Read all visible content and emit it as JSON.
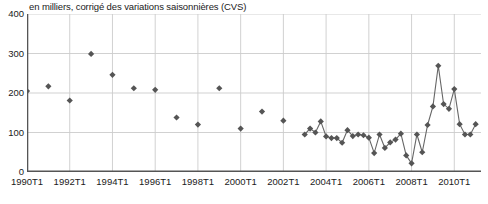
{
  "subtitle": "en milliers, corrigé des variations saisonnières (CVS)",
  "colors": {
    "marker": "#555555",
    "line": "#666666",
    "grid": "#cccccc",
    "axis": "#555555",
    "text": "#1a1a1a",
    "background": "#ffffff"
  },
  "chart_data": {
    "type": "scatter",
    "title": "",
    "subtitle": "en milliers, corrigé des variations saisonnières (CVS)",
    "xlabel": "",
    "ylabel": "",
    "ylim": [
      0,
      400
    ],
    "yticks": [
      0,
      100,
      200,
      300,
      400
    ],
    "ytick_labels": [
      "0",
      "100",
      "200",
      "300",
      "400"
    ],
    "xlim": [
      1990,
      2011.25
    ],
    "xticks": [
      1990,
      1992,
      1994,
      1996,
      1998,
      2000,
      2002,
      2004,
      2006,
      2008,
      2010
    ],
    "xtick_labels": [
      "1990T1",
      "1992T1",
      "1994T1",
      "1996T1",
      "1998T1",
      "2000T1",
      "2002T1",
      "2004T1",
      "2006T1",
      "2008T1",
      "2010T1"
    ],
    "grid": true,
    "legend": "none",
    "series": [
      {
        "name": "Points annuels (non reliés)",
        "marker": "diamond",
        "connected": false,
        "x": [
          1990,
          1991,
          1992,
          1993,
          1994,
          1995,
          1996,
          1997,
          1998,
          1999,
          2000,
          2001,
          2002
        ],
        "values": [
          205,
          217,
          181,
          299,
          246,
          212,
          208,
          138,
          120,
          212,
          110,
          153,
          130
        ]
      },
      {
        "name": "Série trimestrielle (reliée)",
        "marker": "diamond",
        "connected": true,
        "x": [
          2003.0,
          2003.25,
          2003.5,
          2003.75,
          2004.0,
          2004.25,
          2004.5,
          2004.75,
          2005.0,
          2005.25,
          2005.5,
          2005.75,
          2006.0,
          2006.25,
          2006.5,
          2006.75,
          2007.0,
          2007.25,
          2007.5,
          2007.75,
          2008.0,
          2008.25,
          2008.5,
          2008.75,
          2009.0,
          2009.25,
          2009.5,
          2009.75,
          2010.0,
          2010.25,
          2010.5,
          2010.75,
          2011.0
        ],
        "values": [
          95,
          110,
          100,
          128,
          90,
          86,
          86,
          74,
          106,
          91,
          95,
          93,
          87,
          48,
          95,
          61,
          75,
          82,
          97,
          42,
          22,
          95,
          50,
          119,
          166,
          269,
          172,
          160,
          210,
          121,
          95,
          95,
          121
        ]
      }
    ]
  }
}
